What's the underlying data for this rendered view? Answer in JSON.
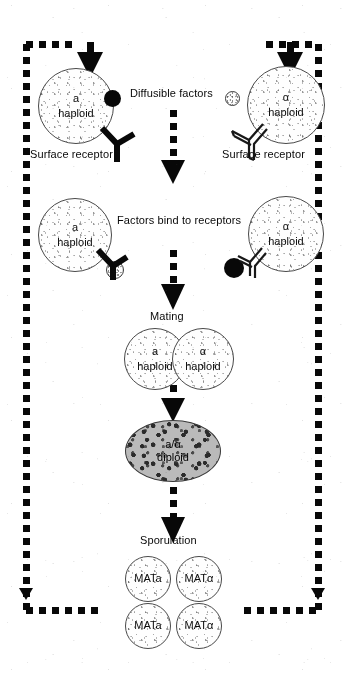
{
  "figure": {
    "colors": {
      "ink": "#0a0a0a",
      "cell_outline": "#4a4a4a",
      "diploid_fill": "#b9b9b9",
      "background": "#fdfdfd"
    }
  },
  "stage_diffusion": {
    "caption": "Diffusible factors",
    "left_cell": {
      "genotype": "a",
      "ploidy": "haploid"
    },
    "right_cell": {
      "genotype": "α",
      "ploidy": "haploid"
    },
    "left_receptor_label": "Surface receptor",
    "right_receptor_label": "Surface receptor",
    "a_factor": "a-factor",
    "alpha_factor": "α-factor"
  },
  "stage_binding": {
    "caption": "Factors bind to receptors",
    "left_cell": {
      "genotype": "a",
      "ploidy": "haploid"
    },
    "right_cell": {
      "genotype": "α",
      "ploidy": "haploid"
    },
    "left_bound_factor": "α-factor",
    "right_bound_factor": "a-factor"
  },
  "stage_mating": {
    "caption": "Mating",
    "left_cell": {
      "genotype": "a",
      "ploidy": "haploid"
    },
    "right_cell": {
      "genotype": "α",
      "ploidy": "haploid"
    }
  },
  "stage_diploid": {
    "genotype": "a/α",
    "ploidy": "diploid"
  },
  "stage_sporulation": {
    "caption": "Sporulation",
    "spores": [
      {
        "label": "MATa"
      },
      {
        "label": "MATα"
      },
      {
        "label": "MATa"
      },
      {
        "label": "MATα"
      }
    ]
  },
  "icons": {
    "arrow_down": "arrow-down-icon",
    "dashed_arrow": "dashed-arrow-down-icon",
    "receptor": "y-receptor-icon",
    "recycle_frame": "dashed-recycle-frame-icon"
  }
}
